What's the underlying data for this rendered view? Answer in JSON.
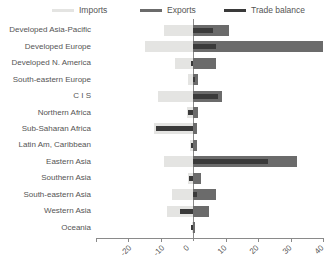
{
  "chart_data": {
    "type": "bar",
    "orientation": "horizontal",
    "title": "",
    "subtitle": "",
    "xlabel": "",
    "ylabel": "",
    "xlim": [
      -30,
      40
    ],
    "xticks": [
      -30,
      -20,
      -10,
      0,
      10,
      20,
      30,
      40
    ],
    "xtick_labels": [
      "-30",
      "-20",
      "-10",
      "0",
      "10",
      "20",
      "30",
      "40"
    ],
    "grid": false,
    "legend_position": "top",
    "zero_reference_line": true,
    "categories": [
      "Developed Asia-Pacific",
      "Developed Europe",
      "Developed N. America",
      "South-eastern Europe",
      "C I S",
      "Northern Africa",
      "Sub-Saharan Africa",
      "Latin Am, Caribbean",
      "Eastern Asia",
      "Southern Asia",
      "South-eastern Asia",
      "Western Asia",
      "Oceania"
    ],
    "series": [
      {
        "name": "Imports",
        "color": "#e4e4e2",
        "values": [
          -9.0,
          -15.0,
          -5.5,
          -1.5,
          -11.0,
          -2.0,
          -12.0,
          -1.0,
          -9.0,
          -1.5,
          -6.5,
          -8.0,
          -0.5
        ]
      },
      {
        "name": "Exports",
        "color": "#6b6b6b",
        "values": [
          11.0,
          40.0,
          7.0,
          1.5,
          9.0,
          1.5,
          1.0,
          1.0,
          32.0,
          2.5,
          7.0,
          5.0,
          0.5
        ]
      },
      {
        "name": "Trade balance",
        "color": "#3a3a3a",
        "values": [
          6.0,
          7.0,
          -0.8,
          0.6,
          7.5,
          -1.5,
          -11.5,
          -0.6,
          23.0,
          -1.2,
          1.0,
          -4.0,
          -0.8
        ]
      }
    ]
  },
  "legend": {
    "items": [
      {
        "label": "Imports",
        "color": "#e4e4e2"
      },
      {
        "label": "Exports",
        "color": "#6b6b6b"
      },
      {
        "label": "Trade balance",
        "color": "#3a3a3a"
      }
    ]
  },
  "colors": {
    "imports": "#e4e4e2",
    "exports": "#6b6b6b",
    "balance": "#3a3a3a",
    "axis": "#8a8a8a",
    "text": "#555555",
    "background": "#ffffff"
  }
}
